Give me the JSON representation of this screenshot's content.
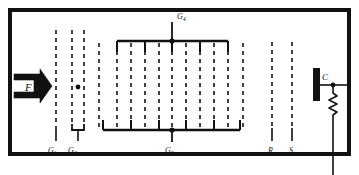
{
  "figure": {
    "background_color": "#ffffff",
    "line_color": "#111111",
    "frame": {
      "x": 8,
      "y": 8,
      "width": 343,
      "height": 148,
      "stroke_width": 4
    }
  },
  "labels": {
    "beam": "F",
    "grid1": "G",
    "grid1_sub": "1",
    "grid2": "G",
    "grid2_sub": "2",
    "grid3": "G",
    "grid3_sub": "3",
    "grid4": "G",
    "grid4_sub": "4",
    "repeller": "R",
    "shield": "S",
    "collector": "C"
  },
  "elements": {
    "beam_arrow": {
      "name": "electron-beam-arrow",
      "x": 14,
      "y": 72,
      "width": 40,
      "height": 28
    },
    "g1_line": {
      "x": 56,
      "y_top": 30,
      "y_bottom": 138
    },
    "g2_lines": {
      "x_left": 72,
      "x_right": 82,
      "y_top": 30,
      "y_bottom": 126,
      "dot_x": 77,
      "dot_y": 87,
      "stem_y_bottom": 140
    },
    "g34_grid": {
      "x_start": 99,
      "x_end": 243,
      "top_bar_y": 41,
      "bottom_bar_y": 131,
      "top_bar_x1": 117,
      "top_bar_x2": 228,
      "bottom_bar_x1": 103,
      "bottom_bar_x2": 240,
      "node_top": {
        "x": 172,
        "y": 41
      },
      "node_bottom": {
        "x": 172,
        "y": 131
      },
      "g4_stem_y_top": 22,
      "g3_stem_y_bottom": 141,
      "dashed_x": [
        99,
        117,
        130,
        144,
        158,
        172,
        186,
        200,
        214,
        228,
        243
      ]
    },
    "r_line": {
      "x": 272,
      "y_top": 42,
      "y_bottom": 138
    },
    "s_line": {
      "x": 292,
      "y_top": 42,
      "y_bottom": 138
    },
    "collector_plate": {
      "x": 313,
      "y": 68,
      "width": 7,
      "height": 32
    },
    "output_node": {
      "x": 333,
      "y": 85
    },
    "output_wire_right_x": 351,
    "resistor": {
      "x": 333,
      "y_top": 93,
      "y_bottom": 119,
      "zig_count": 5,
      "amplitude": 4
    },
    "output_lead_y_bottom": 175
  },
  "annotations": {
    "label_positions": {
      "beam": {
        "x": 26,
        "y": 92
      },
      "grid1": {
        "x": 52,
        "y": 152
      },
      "grid2": {
        "x": 70,
        "y": 152
      },
      "grid3": {
        "x": 168,
        "y": 152
      },
      "grid4": {
        "x": 178,
        "y": 18
      },
      "repeller": {
        "x": 269,
        "y": 152
      },
      "shield": {
        "x": 289,
        "y": 152
      },
      "collector": {
        "x": 323,
        "y": 80
      }
    }
  }
}
